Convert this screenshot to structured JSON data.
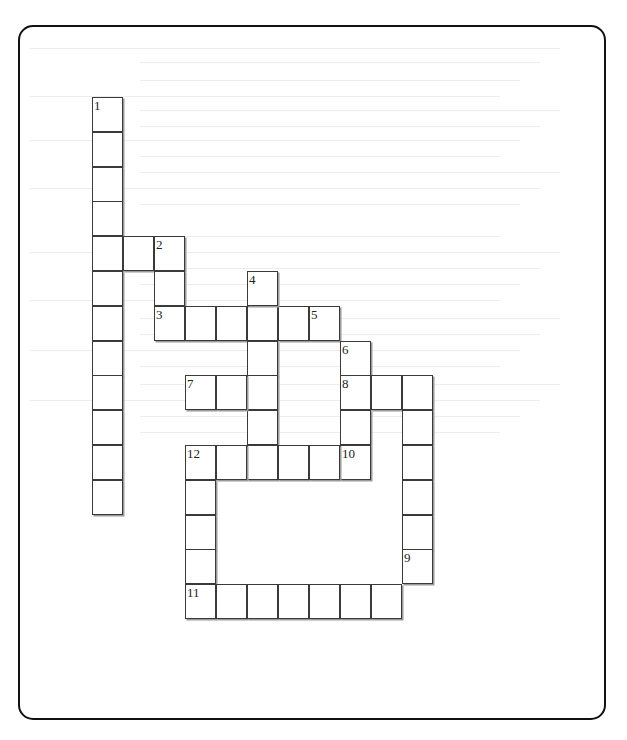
{
  "page": {
    "type": "crossword-puzzle",
    "header_cutoff_text": "",
    "frame": {
      "border_color": "#111111",
      "corner_radius_px": 15
    }
  },
  "crossword": {
    "cell_width_px": 31,
    "cell_height_px": 35,
    "origin": {
      "x": 92,
      "y": 97
    },
    "clue_numbers": [
      "1",
      "2",
      "3",
      "4",
      "5",
      "6",
      "7",
      "8",
      "9",
      "10",
      "11",
      "12"
    ],
    "cells": [
      {
        "r": 0,
        "c": 0,
        "n": "1"
      },
      {
        "r": 1,
        "c": 0
      },
      {
        "r": 2,
        "c": 0
      },
      {
        "r": 3,
        "c": 0
      },
      {
        "r": 4,
        "c": 0
      },
      {
        "r": 5,
        "c": 0
      },
      {
        "r": 6,
        "c": 0
      },
      {
        "r": 7,
        "c": 0
      },
      {
        "r": 8,
        "c": 0
      },
      {
        "r": 9,
        "c": 0
      },
      {
        "r": 10,
        "c": 0
      },
      {
        "r": 11,
        "c": 0
      },
      {
        "r": 4,
        "c": 1
      },
      {
        "r": 4,
        "c": 2,
        "n": "2"
      },
      {
        "r": 5,
        "c": 2
      },
      {
        "r": 6,
        "c": 2,
        "n": "3"
      },
      {
        "r": 6,
        "c": 3
      },
      {
        "r": 6,
        "c": 4
      },
      {
        "r": 6,
        "c": 5
      },
      {
        "r": 6,
        "c": 6
      },
      {
        "r": 6,
        "c": 7,
        "n": "5"
      },
      {
        "r": 5,
        "c": 5,
        "n": "4"
      },
      {
        "r": 7,
        "c": 5
      },
      {
        "r": 8,
        "c": 5
      },
      {
        "r": 9,
        "c": 5
      },
      {
        "r": 10,
        "c": 5
      },
      {
        "r": 7,
        "c": 8,
        "n": "6"
      },
      {
        "r": 8,
        "c": 8,
        "n": "8"
      },
      {
        "r": 9,
        "c": 8
      },
      {
        "r": 10,
        "c": 8,
        "n": "10"
      },
      {
        "r": 8,
        "c": 3,
        "n": "7"
      },
      {
        "r": 8,
        "c": 4
      },
      {
        "r": 8,
        "c": 9
      },
      {
        "r": 8,
        "c": 10
      },
      {
        "r": 9,
        "c": 10
      },
      {
        "r": 10,
        "c": 10
      },
      {
        "r": 11,
        "c": 10
      },
      {
        "r": 12,
        "c": 10
      },
      {
        "r": 13,
        "c": 10,
        "n": "9"
      },
      {
        "r": 10,
        "c": 3,
        "n": "12"
      },
      {
        "r": 10,
        "c": 4
      },
      {
        "r": 10,
        "c": 6
      },
      {
        "r": 10,
        "c": 7
      },
      {
        "r": 11,
        "c": 3
      },
      {
        "r": 12,
        "c": 3
      },
      {
        "r": 13,
        "c": 3
      },
      {
        "r": 14,
        "c": 3,
        "n": "11"
      },
      {
        "r": 14,
        "c": 4
      },
      {
        "r": 14,
        "c": 5
      },
      {
        "r": 14,
        "c": 6
      },
      {
        "r": 14,
        "c": 7
      },
      {
        "r": 14,
        "c": 8
      },
      {
        "r": 14,
        "c": 9
      }
    ]
  }
}
